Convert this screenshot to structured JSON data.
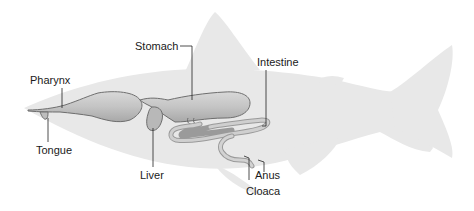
{
  "diagram": {
    "colors": {
      "silhouette": "#e8e8e8",
      "organ_fill": "#c9c9c9",
      "organ_stroke": "#6e6e6e",
      "leader_line": "#222222",
      "text": "#1a1a1a"
    },
    "labels": {
      "stomach": "Stomach",
      "pharynx": "Pharynx",
      "intestine": "Intestine",
      "tongue": "Tongue",
      "liver": "Liver",
      "anus": "Anus",
      "cloaca": "Cloaca"
    }
  }
}
